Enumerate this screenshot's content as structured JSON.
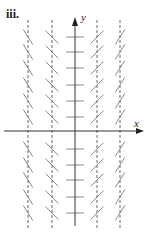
{
  "figure": {
    "panel_label": "iii.",
    "x_axis_label": "x",
    "y_axis_label": "y",
    "colors": {
      "axis": "#333333",
      "segment": "#888888",
      "dashed": "#666666",
      "background": "#ffffff"
    }
  },
  "chart_data": {
    "type": "slope_field",
    "title": "iii.",
    "xlabel": "x",
    "ylabel": "y",
    "origin_px": [
      75,
      131
    ],
    "columns": [
      {
        "x_px": 28,
        "slope_direction": "negative",
        "steepness": "steep",
        "dashed_guide": true
      },
      {
        "x_px": 52,
        "slope_direction": "negative",
        "steepness": "moderate",
        "dashed_guide": true
      },
      {
        "x_px": 75,
        "slope_direction": "zero",
        "steepness": "horizontal",
        "dashed_guide": false
      },
      {
        "x_px": 97,
        "slope_direction": "positive",
        "steepness": "moderate",
        "dashed_guide": true
      },
      {
        "x_px": 120,
        "slope_direction": "positive",
        "steepness": "steep",
        "dashed_guide": true
      }
    ],
    "rows_px": [
      37,
      52,
      68,
      85,
      101,
      117,
      149,
      165,
      180,
      197,
      213
    ],
    "segment_slopes": {
      "col_28": -1.6,
      "col_52": -1.0,
      "col_75": 0,
      "col_97": 1.0,
      "col_120": 1.6
    },
    "grid": false,
    "legend": null
  }
}
